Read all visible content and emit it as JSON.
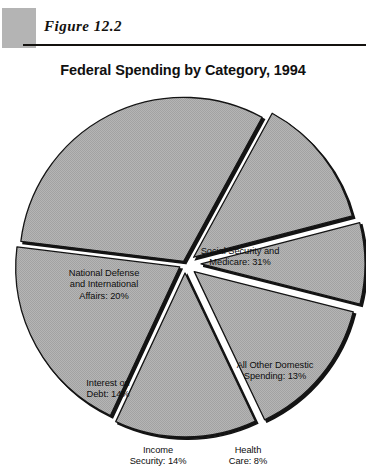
{
  "figure": {
    "label": "Figure  12.2",
    "swatch_color": "#b4b4b4",
    "rule_color": "#14120f"
  },
  "chart_data": {
    "type": "pie",
    "title": "Federal Spending by Category, 1994",
    "subtitle": "",
    "xlabel": "",
    "ylabel": "",
    "legend_position": "none",
    "grid": false,
    "units": "percent",
    "total": 100,
    "slice_fill_color": "#b0b0b0",
    "slice_edge_color": "#141414",
    "background_color": "#ffffff",
    "categories": [
      "Social Security and Medicare",
      "All Other Domestic Spending",
      "Health Care",
      "Income Security",
      "Interest on Debt",
      "National Defense and International Affairs"
    ],
    "values": [
      31,
      13,
      8,
      14,
      14,
      20
    ],
    "labels": [
      "Social Security and\nMedicare: 31%",
      "All Other Domestic\nSpending: 13%",
      "Health\nCare: 8%",
      "Income\nSecurity: 14%",
      "Interest on\nDebt: 14%",
      "National Defense\nand International\nAffairs: 20%"
    ],
    "slices": [
      {
        "name": "Social Security and Medicare",
        "value": 31,
        "label": "Social Security and\nMedicare: 31%",
        "percent": "31%"
      },
      {
        "name": "All Other Domestic Spending",
        "value": 13,
        "label": "All Other Domestic\nSpending: 13%",
        "percent": "13%"
      },
      {
        "name": "Health Care",
        "value": 8,
        "label": "Health\nCare: 8%",
        "percent": "8%"
      },
      {
        "name": "Income Security",
        "value": 14,
        "label": "Income\nSecurity: 14%",
        "percent": "14%"
      },
      {
        "name": "Interest on Debt",
        "value": 14,
        "label": "Interest on\nDebt: 14%",
        "percent": "14%"
      },
      {
        "name": "National Defense and International Affairs",
        "value": 20,
        "label": "National Defense\nand International\nAffairs: 20%",
        "percent": "20%"
      }
    ]
  }
}
